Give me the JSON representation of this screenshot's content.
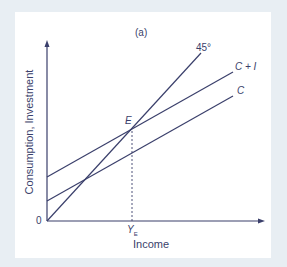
{
  "figure": {
    "panel_label": "(a)",
    "x_axis_label": "Income",
    "y_axis_label": "Consumption, Investment",
    "origin_label": "0",
    "equilibrium_point_label": "E",
    "equilibrium_income_label": "Y",
    "equilibrium_income_subscript": "E",
    "lines": [
      {
        "name": "45-degree line",
        "label": "45°"
      },
      {
        "name": "aggregate demand",
        "label": "C + I"
      },
      {
        "name": "consumption",
        "label": "C"
      }
    ],
    "colors": {
      "line": "#3a3f6b",
      "background": "#e8eef3",
      "panel": "#ffffff"
    }
  }
}
